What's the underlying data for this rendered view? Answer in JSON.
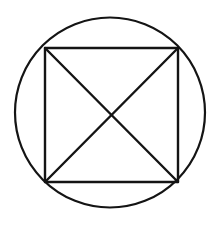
{
  "figure": {
    "name": "square-inscribed-in-circle",
    "background_color": "#ffffff",
    "stroke_color": "#141414",
    "canvas": {
      "width": 219,
      "height": 225
    },
    "elements": {
      "circle": {
        "label": "circle",
        "cx": 110,
        "cy": 112.5,
        "r": 95,
        "stroke_width": 2.2
      },
      "square": {
        "label": "square",
        "stroke_width": 2.4,
        "corners": [
          {
            "name": "top-left",
            "x": 45,
            "y": 48
          },
          {
            "name": "top-right",
            "x": 178,
            "y": 48
          },
          {
            "name": "bottom-right",
            "x": 178,
            "y": 182
          },
          {
            "name": "bottom-left",
            "x": 45,
            "y": 182
          }
        ]
      },
      "diagonals": {
        "label": "diagonals",
        "stroke_width": 2.4,
        "lines": [
          {
            "name": "diagonal-tl-br",
            "x1": 45,
            "y1": 48,
            "x2": 178,
            "y2": 182
          },
          {
            "name": "diagonal-tr-bl",
            "x1": 178,
            "y1": 48,
            "x2": 45,
            "y2": 182
          }
        ],
        "intersection": {
          "x": 111,
          "y": 115
        }
      }
    }
  }
}
